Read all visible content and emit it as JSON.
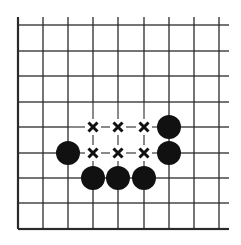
{
  "diagram": {
    "type": "go-board-fragment",
    "colors": {
      "background": "#ffffff",
      "line": "#2a2a2a",
      "stone": "#111111",
      "mark": "#111111"
    },
    "grid": {
      "columns_x": [
        18,
        43,
        68,
        93,
        118,
        144,
        169,
        194,
        219
      ],
      "rows_y": [
        25,
        51,
        76,
        102,
        127,
        153,
        178,
        203,
        229
      ],
      "right_extent": 229,
      "top_extent": 17,
      "edges": [
        "left",
        "bottom"
      ]
    },
    "black_stones": [
      {
        "col": 2,
        "row": 5
      },
      {
        "col": 3,
        "row": 6
      },
      {
        "col": 4,
        "row": 6
      },
      {
        "col": 5,
        "row": 6
      },
      {
        "col": 6,
        "row": 4
      },
      {
        "col": 6,
        "row": 5
      }
    ],
    "x_marks": [
      {
        "col": 3,
        "row": 4
      },
      {
        "col": 4,
        "row": 4
      },
      {
        "col": 5,
        "row": 4
      },
      {
        "col": 3,
        "row": 5
      },
      {
        "col": 4,
        "row": 5
      },
      {
        "col": 5,
        "row": 5
      }
    ],
    "stone_radius": 12
  }
}
